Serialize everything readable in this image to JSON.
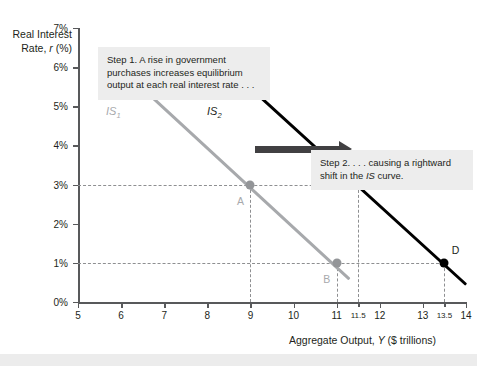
{
  "figure": {
    "y_axis_title_line1": "Real Interest",
    "y_axis_title_line2_pre": "Rate, ",
    "y_axis_title_line2_ital": "r",
    "y_axis_title_line2_post": " (%)",
    "x_axis_title_pre": "Aggregate Output, ",
    "x_axis_title_ital": "Y",
    "x_axis_title_post": " ($ trillions)"
  },
  "callouts": {
    "step1": "Step 1. A rise in government purchases increases equilibrium output at each real interest rate . . .",
    "step2_pre": "Step 2. . . . causing a rightward shift in the ",
    "step2_ital": "IS",
    "step2_post": " curve."
  },
  "curves": {
    "is1": {
      "label_base": "IS",
      "label_sub": "1"
    },
    "is2": {
      "label_base": "IS",
      "label_sub": "2"
    }
  },
  "points": {
    "A": {
      "label": "A"
    },
    "B": {
      "label": "B"
    },
    "C": {
      "label": "C"
    },
    "D": {
      "label": "D"
    }
  },
  "chart_data": {
    "type": "line",
    "title": "",
    "xlabel": "Aggregate Output, Y ($ trillions)",
    "ylabel": "Real Interest Rate, r (%)",
    "xlim": [
      5,
      14
    ],
    "ylim": [
      0,
      7
    ],
    "grid": false,
    "legend": "inline curve labels",
    "xticks": [
      5,
      6,
      7,
      8,
      9,
      10,
      11,
      11.5,
      12,
      13,
      13.5,
      14
    ],
    "xtick_labels": [
      "5",
      "6",
      "7",
      "8",
      "9",
      "10",
      "11",
      "11.5",
      "12",
      "13",
      "13.5",
      "14"
    ],
    "yticks": [
      0,
      1,
      2,
      3,
      4,
      5,
      6,
      7
    ],
    "ytick_labels": [
      "0%",
      "1%",
      "2%",
      "3%",
      "4%",
      "5%",
      "6%",
      "7%"
    ],
    "series": [
      {
        "name": "IS1",
        "color": "#a7a9ac",
        "x": [
          6.0,
          11.3
        ],
        "y": [
          6.0,
          0.62
        ]
      },
      {
        "name": "IS2",
        "color": "#000000",
        "x": [
          8.5,
          14.0
        ],
        "y": [
          6.0,
          0.48
        ]
      }
    ],
    "annotations": [
      {
        "label": "A",
        "x": 9.0,
        "y": 3.0,
        "series": "IS1",
        "color": "#939598"
      },
      {
        "label": "B",
        "x": 11.0,
        "y": 1.0,
        "series": "IS1",
        "color": "#939598"
      },
      {
        "label": "C",
        "x": 11.5,
        "y": 3.0,
        "series": "IS2",
        "color": "#000000"
      },
      {
        "label": "D",
        "x": 13.5,
        "y": 1.0,
        "series": "IS2",
        "color": "#000000"
      }
    ],
    "guide_lines": [
      {
        "type": "h",
        "y": 3.0,
        "from_x": 5,
        "to_x": 11.5
      },
      {
        "type": "h",
        "y": 1.0,
        "from_x": 5,
        "to_x": 13.5
      },
      {
        "type": "v",
        "x": 9.0,
        "from_y": 0,
        "to_y": 3.0
      },
      {
        "type": "v",
        "x": 11.0,
        "from_y": 0,
        "to_y": 1.0
      },
      {
        "type": "v",
        "x": 11.5,
        "from_y": 0,
        "to_y": 3.0
      },
      {
        "type": "v",
        "x": 13.5,
        "from_y": 0,
        "to_y": 1.0
      }
    ],
    "shift_arrow": {
      "from_x": 9.1,
      "to_x": 11.3,
      "y": 3.9,
      "color": "#414042"
    }
  }
}
